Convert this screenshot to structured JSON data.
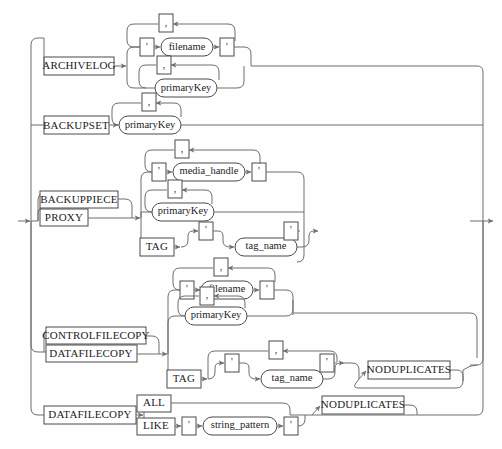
{
  "diagram": {
    "type": "railroad-syntax-diagram",
    "colors": {
      "background": "#fefefe",
      "line": "#6f6f6f",
      "box_border": "#4a4a4a",
      "text": "#1c1c1c"
    },
    "entry_arrow": "left-entry-arrow",
    "exit_arrow": "right-exit-arrow"
  },
  "terminals": {
    "archivelog": "ARCHIVELOG",
    "backupset": "BACKUPSET",
    "backuppiece": "BACKUPPIECE",
    "proxy": "PROXY",
    "controlfilecopy": "CONTROLFILECOPY",
    "datafilecopy": "DATAFILECOPY",
    "datafilecopy2": "DATAFILECOPY",
    "tag1": "TAG",
    "tag2": "TAG",
    "noduplicates1": "NODUPLICATES",
    "noduplicates2": "NODUPLICATES",
    "all": "ALL",
    "like": "LIKE",
    "quote": "'",
    "comma": ","
  },
  "nonterminals": {
    "filename1": "filename",
    "filename2": "filename",
    "primarykey1": "primaryKey",
    "primarykey2": "primaryKey",
    "primarykey3": "primaryKey",
    "primarykey4": "primaryKey",
    "media_handle": "media_handle",
    "tag_name1": "tag_name",
    "tag_name2": "tag_name",
    "string_pattern": "string_pattern"
  },
  "branches": [
    {
      "name": "archivelog-branch",
      "keyword": "ARCHIVELOG",
      "alternatives": [
        {
          "items": [
            "'",
            "filename",
            "'"
          ],
          "repeat_separator": ","
        },
        {
          "items": [
            "primaryKey"
          ],
          "repeat_separator": ","
        }
      ]
    },
    {
      "name": "backupset-branch",
      "keyword": "BACKUPSET",
      "alternatives": [
        {
          "items": [
            "primaryKey"
          ],
          "repeat_separator": ","
        }
      ]
    },
    {
      "name": "backuppiece-proxy-branch",
      "keyword": [
        "BACKUPPIECE",
        "PROXY"
      ],
      "alternatives": [
        {
          "items": [
            "'",
            "media_handle",
            "'"
          ],
          "repeat_separator": ","
        },
        {
          "items": [
            "primaryKey"
          ],
          "repeat_separator": ","
        },
        {
          "items": [
            "TAG",
            "'",
            "tag_name",
            "'"
          ],
          "repeat_separator": ","
        }
      ]
    },
    {
      "name": "controlfilecopy-datafilecopy-branch",
      "keyword": [
        "CONTROLFILECOPY",
        "DATAFILECOPY"
      ],
      "alternatives": [
        {
          "items": [
            "'",
            "filename",
            "'"
          ],
          "repeat_separator": ","
        },
        {
          "items": [
            "primaryKey"
          ],
          "repeat_separator": ","
        },
        {
          "items": [
            "TAG",
            "'",
            "tag_name",
            "'",
            "NODUPLICATES"
          ],
          "repeat_separator": ","
        }
      ]
    },
    {
      "name": "datafilecopy-all-like-branch",
      "keyword": "DATAFILECOPY",
      "alternatives": [
        {
          "items": [
            "ALL"
          ]
        },
        {
          "items": [
            "LIKE",
            "'",
            "string_pattern",
            "'"
          ]
        }
      ],
      "optional_suffix": "NODUPLICATES"
    }
  ]
}
